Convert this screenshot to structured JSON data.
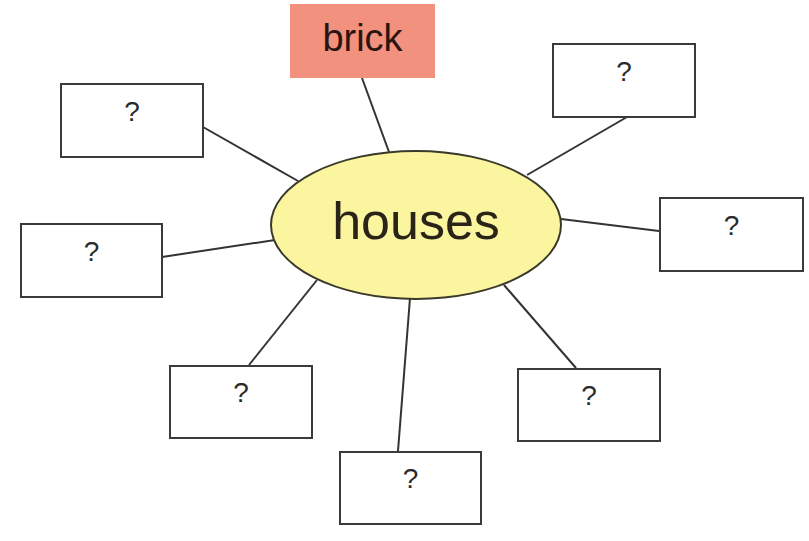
{
  "diagram": {
    "type": "mind-map",
    "center": {
      "label": "houses",
      "fill": "#fbf5a0"
    },
    "nodes": [
      {
        "id": "top",
        "label": "brick",
        "fill": "#f2917d"
      },
      {
        "id": "top-left",
        "label": "?"
      },
      {
        "id": "top-right",
        "label": "?"
      },
      {
        "id": "left",
        "label": "?"
      },
      {
        "id": "right",
        "label": "?"
      },
      {
        "id": "bottom-left",
        "label": "?"
      },
      {
        "id": "bottom-right",
        "label": "?"
      },
      {
        "id": "bottom",
        "label": "?"
      }
    ]
  }
}
